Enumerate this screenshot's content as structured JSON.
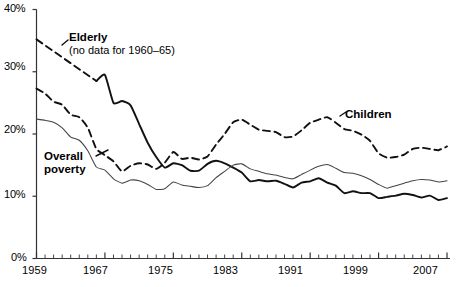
{
  "chart_data": {
    "type": "line",
    "title": "",
    "subtitle": "",
    "xlabel": "",
    "ylabel": "",
    "xlim": [
      1959,
      2007
    ],
    "ylim": [
      0,
      40
    ],
    "grid": false,
    "legend_position": "inline-annotations",
    "y_ticks": [
      "0%",
      "10%",
      "20%",
      "30%",
      "40%"
    ],
    "y_tick_values": [
      0,
      10,
      20,
      30,
      40
    ],
    "x_ticks": [
      "1959",
      "1967",
      "1975",
      "1983",
      "1991",
      "1999",
      "2007"
    ],
    "x_tick_values": [
      1959,
      1967,
      1975,
      1983,
      1991,
      1999,
      2007
    ],
    "x_minor_tick_step": 1,
    "x": [
      1959,
      1960,
      1961,
      1962,
      1963,
      1964,
      1965,
      1966,
      1967,
      1968,
      1969,
      1970,
      1971,
      1972,
      1973,
      1974,
      1975,
      1976,
      1977,
      1978,
      1979,
      1980,
      1981,
      1982,
      1983,
      1984,
      1985,
      1986,
      1987,
      1988,
      1989,
      1990,
      1991,
      1992,
      1993,
      1994,
      1995,
      1996,
      1997,
      1998,
      1999,
      2000,
      2001,
      2002,
      2003,
      2004,
      2005,
      2006,
      2007
    ],
    "series": [
      {
        "name": "Elderly",
        "style": "solid-thick",
        "color": "#111111",
        "note": "no data for 1960-65",
        "gap_years": [
          1960,
          1961,
          1962,
          1963,
          1964,
          1965
        ],
        "values": [
          35.2,
          null,
          null,
          null,
          null,
          null,
          null,
          28.5,
          29.5,
          25.0,
          25.3,
          24.6,
          21.6,
          18.6,
          16.3,
          14.6,
          15.3,
          15.0,
          14.1,
          14.1,
          15.2,
          15.7,
          15.3,
          14.6,
          13.8,
          12.4,
          12.6,
          12.4,
          12.5,
          12.0,
          11.4,
          12.2,
          12.4,
          12.9,
          12.2,
          11.7,
          10.5,
          10.8,
          10.5,
          10.5,
          9.7,
          9.9,
          10.1,
          10.4,
          10.2,
          9.8,
          10.1,
          9.4,
          9.7
        ]
      },
      {
        "name": "Children",
        "style": "dashed",
        "color": "#111111",
        "values": [
          27.3,
          26.5,
          25.2,
          24.7,
          23.1,
          22.7,
          21.0,
          17.6,
          16.6,
          15.6,
          14.0,
          14.9,
          15.3,
          15.1,
          14.4,
          15.4,
          17.1,
          16.0,
          16.2,
          15.9,
          16.4,
          18.3,
          20.0,
          21.9,
          22.3,
          21.5,
          20.7,
          20.5,
          20.3,
          19.5,
          19.6,
          20.6,
          21.8,
          22.3,
          22.7,
          21.8,
          20.8,
          20.5,
          19.9,
          18.9,
          16.9,
          16.2,
          16.3,
          16.7,
          17.6,
          17.8,
          17.6,
          17.4,
          18.0
        ]
      },
      {
        "name": "Overall poverty",
        "style": "solid-thin",
        "color": "#444444",
        "values": [
          22.4,
          22.2,
          21.9,
          21.0,
          19.5,
          19.0,
          17.3,
          14.7,
          14.2,
          12.8,
          12.1,
          12.6,
          12.5,
          11.9,
          11.1,
          11.2,
          12.3,
          11.8,
          11.6,
          11.4,
          11.7,
          13.0,
          14.0,
          15.0,
          15.2,
          14.4,
          14.0,
          13.6,
          13.4,
          13.0,
          12.8,
          13.5,
          14.2,
          14.8,
          15.1,
          14.5,
          13.8,
          13.7,
          13.3,
          12.7,
          11.9,
          11.3,
          11.7,
          12.1,
          12.5,
          12.7,
          12.6,
          12.3,
          12.5
        ]
      }
    ],
    "annotations": [
      {
        "name": "elderly",
        "line1": "Elderly",
        "line2": "(no data for 1960–65)"
      },
      {
        "name": "children",
        "line1": "Children",
        "line2": ""
      },
      {
        "name": "overall",
        "line1": "Overall",
        "line2": "poverty"
      }
    ]
  },
  "axis": {
    "y_labels": [
      "40%",
      "30%",
      "20%",
      "10%",
      "0%"
    ],
    "x_labels": [
      "1959",
      "1967",
      "1975",
      "1983",
      "1991",
      "1999",
      "2007"
    ]
  },
  "colors": {
    "axis": "#333333",
    "ink": "#111111",
    "thin_line": "#555555",
    "background": "#ffffff"
  }
}
